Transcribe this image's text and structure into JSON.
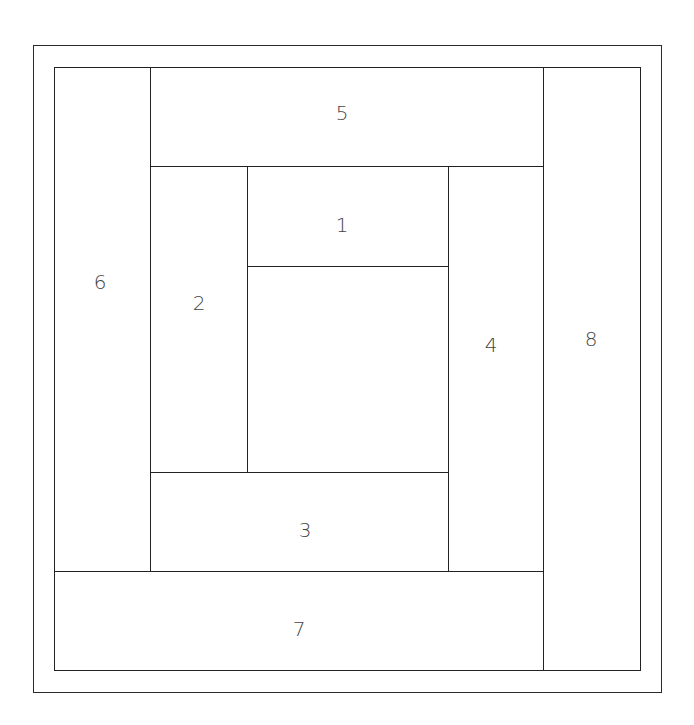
{
  "diagram": {
    "outer_frame": {
      "x": 33,
      "y": 45,
      "w": 629,
      "h": 648
    },
    "inner_square": {
      "x": 54,
      "y": 67,
      "w": 587,
      "h": 604
    },
    "line_color": "#222222",
    "label_color": "#444444",
    "blocks": [
      {
        "id": "center",
        "label": "",
        "x": 247,
        "y": 266,
        "w": 203,
        "h": 208,
        "lx": 348,
        "ly": 370
      },
      {
        "id": "1",
        "label": "1",
        "x": 247,
        "y": 166,
        "w": 203,
        "h": 101,
        "lx": 342,
        "ly": 225
      },
      {
        "id": "2",
        "label": "2",
        "x": 150,
        "y": 166,
        "w": 98,
        "h": 308,
        "lx": 199,
        "ly": 303
      },
      {
        "id": "3",
        "label": "3",
        "x": 150,
        "y": 472,
        "w": 300,
        "h": 101,
        "lx": 305,
        "ly": 530
      },
      {
        "id": "4",
        "label": "4",
        "x": 448,
        "y": 166,
        "w": 97,
        "h": 407,
        "lx": 491,
        "ly": 345
      },
      {
        "id": "5",
        "label": "5",
        "x": 150,
        "y": 67,
        "w": 395,
        "h": 100,
        "lx": 342,
        "ly": 113
      },
      {
        "id": "6",
        "label": "6",
        "x": 54,
        "y": 67,
        "w": 97,
        "h": 506,
        "lx": 100,
        "ly": 282
      },
      {
        "id": "7",
        "label": "7",
        "x": 54,
        "y": 571,
        "w": 491,
        "h": 100,
        "lx": 299,
        "ly": 629
      },
      {
        "id": "8",
        "label": "8",
        "x": 543,
        "y": 67,
        "w": 98,
        "h": 604,
        "lx": 591,
        "ly": 339
      }
    ]
  }
}
